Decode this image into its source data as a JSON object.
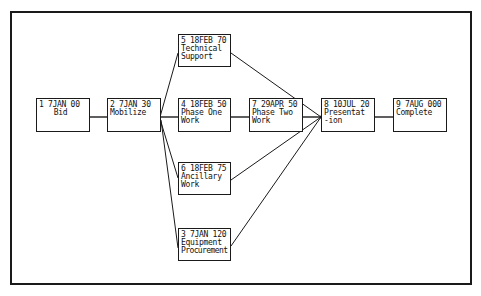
{
  "diagram": {
    "type": "network-diagram",
    "nodes": [
      {
        "id": 1,
        "header": "1 7JAN 00",
        "lines": [
          "Bid"
        ],
        "x": 36,
        "y": 98
      },
      {
        "id": 2,
        "header": "2 7JAN 30",
        "lines": [
          "Mobilize"
        ],
        "x": 107,
        "y": 98
      },
      {
        "id": 5,
        "header": "5 18FEB 70",
        "lines": [
          "Technical",
          "Support"
        ],
        "x": 178,
        "y": 34
      },
      {
        "id": 4,
        "header": "4 18FEB 50",
        "lines": [
          "Phase One",
          "Work"
        ],
        "x": 178,
        "y": 98
      },
      {
        "id": 6,
        "header": "6 18FEB 75",
        "lines": [
          "Ancillary",
          "Work"
        ],
        "x": 178,
        "y": 162
      },
      {
        "id": 3,
        "header": "3 7JAN 120",
        "lines": [
          "Equipment",
          "Procurement"
        ],
        "x": 178,
        "y": 228
      },
      {
        "id": 7,
        "header": "7 29APR 50",
        "lines": [
          "Phase Two",
          "Work"
        ],
        "x": 249,
        "y": 98
      },
      {
        "id": 8,
        "header": "8 10JUL 20",
        "lines": [
          "Presentat",
          "-ion"
        ],
        "x": 321,
        "y": 98
      },
      {
        "id": 9,
        "header": "9 7AUG 000",
        "lines": [
          "Complete"
        ],
        "x": 393,
        "y": 98
      }
    ],
    "edges": [
      {
        "from": 1,
        "to": 2
      },
      {
        "from": 2,
        "to": 5
      },
      {
        "from": 2,
        "to": 4
      },
      {
        "from": 2,
        "to": 6
      },
      {
        "from": 2,
        "to": 3
      },
      {
        "from": 4,
        "to": 7
      },
      {
        "from": 5,
        "to": 8
      },
      {
        "from": 7,
        "to": 8
      },
      {
        "from": 6,
        "to": 8
      },
      {
        "from": 3,
        "to": 8
      },
      {
        "from": 8,
        "to": 9
      }
    ],
    "colors": {
      "line": "#1a1a1a",
      "background": "#ffffff"
    }
  }
}
